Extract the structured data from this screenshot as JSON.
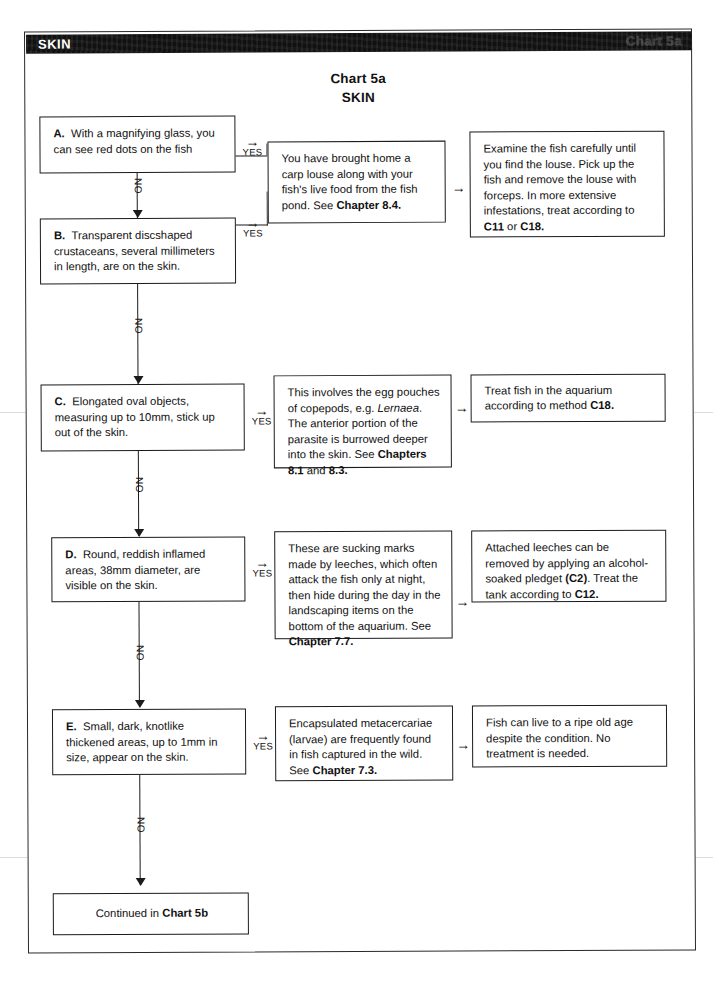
{
  "header": {
    "left_label": "SKIN",
    "right_label": "Chart 5a"
  },
  "title": {
    "line1": "Chart 5a",
    "line2": "SKIN"
  },
  "labels": {
    "yes": "YES",
    "no": "NO",
    "arrow_right": "→"
  },
  "questions": [
    {
      "id": "A",
      "letter": "A.",
      "text": "With a magnifying glass, you can see red dots on the fish"
    },
    {
      "id": "B",
      "letter": "B.",
      "text": "Transparent discshaped crustaceans, several millimeters in length, are on the skin."
    },
    {
      "id": "C",
      "letter": "C.",
      "text": "Elongated oval objects, measuring up to 10mm, stick up out of the skin."
    },
    {
      "id": "D",
      "letter": "D.",
      "text": "Round, reddish inflamed areas, 38mm diameter, are visible on the skin."
    },
    {
      "id": "E",
      "letter": "E.",
      "text": "Small, dark, knotlike thickened areas, up to 1mm in size, appear on the skin."
    }
  ],
  "diagnoses": [
    {
      "id": "AB",
      "text_parts": [
        {
          "t": "You have brought home a carp louse along with your fish's live food from the fish pond. See ",
          "style": "normal"
        },
        {
          "t": "Chapter 8.4.",
          "style": "bold"
        }
      ]
    },
    {
      "id": "C",
      "text_parts": [
        {
          "t": "This involves the egg pouches of copepods, e.g. ",
          "style": "normal"
        },
        {
          "t": "Lernaea",
          "style": "italic"
        },
        {
          "t": ". The anterior portion of the parasite is burrowed deeper into the skin. See ",
          "style": "normal"
        },
        {
          "t": "Chapters 8.1",
          "style": "bold"
        },
        {
          "t": " and ",
          "style": "normal"
        },
        {
          "t": "8.3.",
          "style": "bold"
        }
      ]
    },
    {
      "id": "D",
      "text_parts": [
        {
          "t": "These are sucking marks made by leeches, which often attack the fish only at night, then hide during the day in the landscaping items on the bottom of the aquarium. See ",
          "style": "normal"
        },
        {
          "t": "Chapter 7.7.",
          "style": "bold"
        }
      ]
    },
    {
      "id": "E",
      "text_parts": [
        {
          "t": "Encapsulated metacercariae (larvae) are frequently found in fish captured in the wild. See ",
          "style": "normal"
        },
        {
          "t": "Chapter 7.3.",
          "style": "bold"
        }
      ]
    }
  ],
  "treatments": [
    {
      "id": "AB",
      "text_parts": [
        {
          "t": "Examine the fish carefully until you find the louse. Pick up the fish and remove the louse with forceps. In more extensive infestations, treat according to ",
          "style": "normal"
        },
        {
          "t": "C11",
          "style": "bold"
        },
        {
          "t": " or ",
          "style": "normal"
        },
        {
          "t": "C18.",
          "style": "bold"
        }
      ]
    },
    {
      "id": "C",
      "text_parts": [
        {
          "t": "Treat fish in the aquarium according to method ",
          "style": "normal"
        },
        {
          "t": "C18.",
          "style": "bold"
        }
      ]
    },
    {
      "id": "D",
      "text_parts": [
        {
          "t": "Attached leeches can be removed by applying an alcohol-soaked pledget ",
          "style": "normal"
        },
        {
          "t": "(C2)",
          "style": "bold"
        },
        {
          "t": ". Treat the tank according to ",
          "style": "normal"
        },
        {
          "t": "C12.",
          "style": "bold"
        }
      ]
    },
    {
      "id": "E",
      "text_parts": [
        {
          "t": "Fish can live to a ripe old age despite the condition. No treatment is needed.",
          "style": "normal"
        }
      ]
    }
  ],
  "footer": {
    "text_parts": [
      {
        "t": "Continued in ",
        "style": "normal"
      },
      {
        "t": "Chart 5b",
        "style": "bold"
      }
    ]
  },
  "colors": {
    "ink": "#1b1b1b",
    "band": "#111111",
    "paper": "#ffffff"
  }
}
